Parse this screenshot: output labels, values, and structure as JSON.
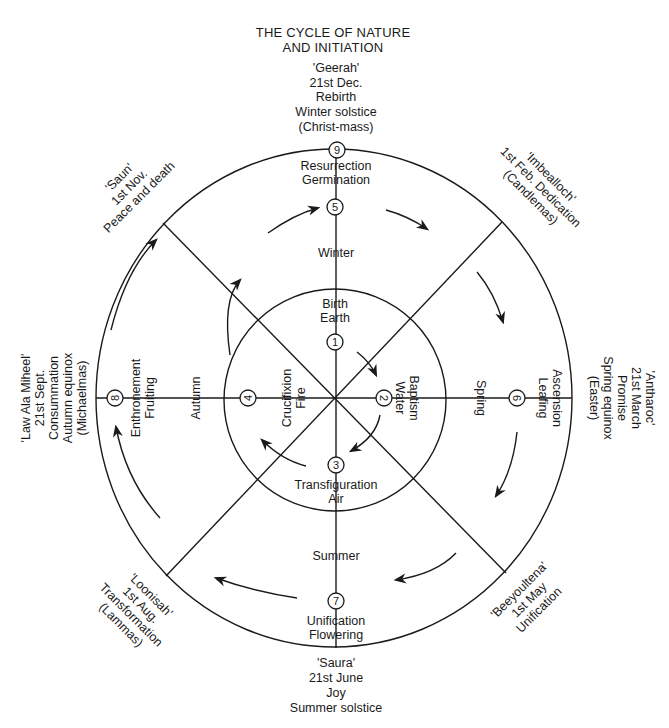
{
  "title": [
    "THE CYCLE OF NATURE",
    "AND INITIATION"
  ],
  "festivals": {
    "winter_solstice": {
      "lines": [
        "'Geerah'",
        "21st Dec.",
        "Rebirth",
        "Winter solstice",
        "(Christ-mass)"
      ]
    },
    "feb": {
      "lines": [
        "'Imbealloch'",
        "1st Feb. Dedication",
        "(Candlemas)"
      ]
    },
    "spring_equinox": {
      "lines": [
        "'Antharoc'",
        "21st March",
        "Promise",
        "Spring equinox",
        "(Easter)"
      ]
    },
    "may": {
      "lines": [
        "'Beeyoultena'",
        "1st May",
        "Unification"
      ]
    },
    "summer_solstice": {
      "lines": [
        "'Saura'",
        "21st June",
        "Joy",
        "Summer solstice"
      ]
    },
    "aug": {
      "lines": [
        "'Loonisah'",
        "1st Aug.",
        "Transformation",
        "(Lammas)"
      ]
    },
    "autumn_equinox": {
      "lines": [
        "'Law Ala Miheel'",
        "21st Sept.",
        "Consummation",
        "Autumn equinox",
        "(Michaelmas)"
      ]
    },
    "nov": {
      "lines": [
        "'Saun'",
        "1st Nov.",
        "Peace and death"
      ]
    }
  },
  "seasons": {
    "winter": "Winter",
    "spring": "Spring",
    "summer": "Summer",
    "autumn": "Autumn"
  },
  "nodes": [
    {
      "n": "1",
      "lines": [
        "Birth",
        "Earth"
      ]
    },
    {
      "n": "2",
      "lines": [
        "Baptism",
        "Water"
      ]
    },
    {
      "n": "3",
      "lines": [
        "Transfiguration",
        "Air"
      ]
    },
    {
      "n": "4",
      "lines": [
        "Crucifixion",
        "Fire"
      ]
    },
    {
      "n": "5",
      "lines": [
        "Resurrection",
        "Germination"
      ]
    },
    {
      "n": "6",
      "lines": [
        "Ascension",
        "Leafing"
      ]
    },
    {
      "n": "7",
      "lines": [
        "Unification",
        "Flowering"
      ]
    },
    {
      "n": "8",
      "lines": [
        "Enthronement",
        "Fruiting"
      ]
    },
    {
      "n": "9",
      "lines": []
    }
  ]
}
